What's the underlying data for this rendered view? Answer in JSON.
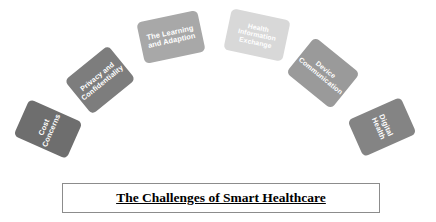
{
  "diagram": {
    "type": "arc-process",
    "nodes": [
      {
        "id": "cost-concerns",
        "label": "Cost Concerns",
        "color": "#6e6e6e",
        "text_color": "#ffffff",
        "rotation_deg": -66,
        "font_size": 7.4
      },
      {
        "id": "privacy-and-confidentiality",
        "label": "Privacy and\nConfidentiality",
        "color": "#7d7d7d",
        "text_color": "#ffffff",
        "rotation_deg": -39,
        "font_size": 7.2
      },
      {
        "id": "the-learning-and-adaption",
        "label": "The Learning\nand Adaption",
        "color": "#a8a8a8",
        "text_color": "#ffffff",
        "rotation_deg": -12,
        "font_size": 7.4
      },
      {
        "id": "health-information-exchange",
        "label": "Health\nInformation\nExchange",
        "color": "#d8d8d8",
        "text_color": "#ffffff",
        "rotation_deg": 12,
        "font_size": 6.8
      },
      {
        "id": "device-communication",
        "label": "Device\nCommunication",
        "color": "#9a9a9a",
        "text_color": "#ffffff",
        "rotation_deg": 39,
        "font_size": 7.0
      },
      {
        "id": "digital-health",
        "label": "Digital Health",
        "color": "#848484",
        "text_color": "#ffffff",
        "rotation_deg": 66,
        "font_size": 7.4
      }
    ]
  },
  "banner": {
    "title": "The Challenges of Smart Healthcare",
    "border_color": "#8c8c8c",
    "background": "#ffffff",
    "text_color": "#000000"
  }
}
